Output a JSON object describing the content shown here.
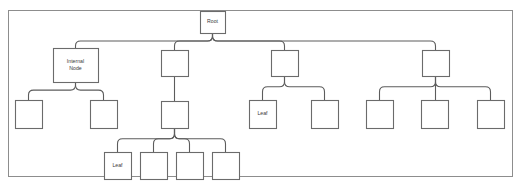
{
  "diagram": {
    "type": "tree",
    "frame": {
      "x": 8,
      "y": 10,
      "width": 504,
      "height": 166
    },
    "colors": {
      "background": "#ffffff",
      "frame_stroke": "#8d8d8d",
      "node_stroke": "#6b6b6b",
      "node_fill": "#ffffff",
      "edge_stroke": "#5c5c5c",
      "label_text": "#3a3a3a"
    },
    "nodes": [
      {
        "id": "root",
        "label": "Root",
        "x": 200,
        "y": 11,
        "w": 25,
        "h": 22,
        "lines": [
          "Root"
        ]
      },
      {
        "id": "n1",
        "label": "Internal Node",
        "x": 53,
        "y": 48,
        "w": 45,
        "h": 34,
        "lines": [
          "Internal",
          "Node"
        ]
      },
      {
        "id": "n2",
        "label": "",
        "x": 161,
        "y": 50,
        "w": 27,
        "h": 26,
        "lines": []
      },
      {
        "id": "n3",
        "label": "",
        "x": 271,
        "y": 50,
        "w": 27,
        "h": 26,
        "lines": []
      },
      {
        "id": "n4",
        "label": "",
        "x": 422,
        "y": 50,
        "w": 27,
        "h": 26,
        "lines": []
      },
      {
        "id": "n1a",
        "label": "",
        "x": 15,
        "y": 100,
        "w": 27,
        "h": 28,
        "lines": []
      },
      {
        "id": "n1b",
        "label": "",
        "x": 90,
        "y": 100,
        "w": 27,
        "h": 28,
        "lines": []
      },
      {
        "id": "n2a",
        "label": "",
        "x": 161,
        "y": 101,
        "w": 27,
        "h": 27,
        "lines": []
      },
      {
        "id": "n3a",
        "label": "Leaf",
        "x": 249,
        "y": 100,
        "w": 27,
        "h": 28,
        "lines": [
          "Leaf"
        ]
      },
      {
        "id": "n3b",
        "label": "",
        "x": 311,
        "y": 100,
        "w": 27,
        "h": 28,
        "lines": []
      },
      {
        "id": "n4a",
        "label": "",
        "x": 366,
        "y": 100,
        "w": 27,
        "h": 28,
        "lines": []
      },
      {
        "id": "n4b",
        "label": "",
        "x": 421,
        "y": 100,
        "w": 27,
        "h": 28,
        "lines": []
      },
      {
        "id": "n4c",
        "label": "",
        "x": 477,
        "y": 100,
        "w": 27,
        "h": 28,
        "lines": []
      },
      {
        "id": "n2a1",
        "label": "Leaf",
        "x": 104,
        "y": 152,
        "w": 27,
        "h": 27,
        "lines": [
          "Leaf"
        ]
      },
      {
        "id": "n2a2",
        "label": "",
        "x": 140,
        "y": 152,
        "w": 27,
        "h": 27,
        "lines": []
      },
      {
        "id": "n2a3",
        "label": "",
        "x": 176,
        "y": 152,
        "w": 27,
        "h": 27,
        "lines": []
      },
      {
        "id": "n2a4",
        "label": "",
        "x": 212,
        "y": 152,
        "w": 27,
        "h": 27,
        "lines": []
      }
    ],
    "edges": [
      {
        "from": "root",
        "to": "n1"
      },
      {
        "from": "root",
        "to": "n2"
      },
      {
        "from": "root",
        "to": "n3"
      },
      {
        "from": "root",
        "to": "n4"
      },
      {
        "from": "n1",
        "to": "n1a"
      },
      {
        "from": "n1",
        "to": "n1b"
      },
      {
        "from": "n2",
        "to": "n2a"
      },
      {
        "from": "n3",
        "to": "n3a"
      },
      {
        "from": "n3",
        "to": "n3b"
      },
      {
        "from": "n4",
        "to": "n4a"
      },
      {
        "from": "n4",
        "to": "n4b"
      },
      {
        "from": "n4",
        "to": "n4c"
      },
      {
        "from": "n2a",
        "to": "n2a1"
      },
      {
        "from": "n2a",
        "to": "n2a2"
      },
      {
        "from": "n2a",
        "to": "n2a3"
      },
      {
        "from": "n2a",
        "to": "n2a4"
      }
    ]
  }
}
